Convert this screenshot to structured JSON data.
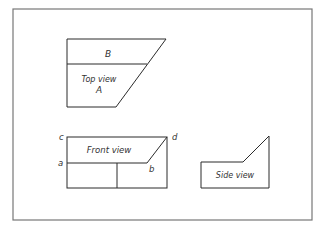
{
  "diagram": {
    "type": "orthographic-projection",
    "colors": {
      "line": "#2b2b2b",
      "frame": "#777777",
      "text": "#333333",
      "background": "#ffffff"
    },
    "top_view": {
      "region_upper_label": "B",
      "title": "Top view",
      "region_lower_label": "A"
    },
    "front_view": {
      "title": "Front view",
      "corner_labels": {
        "c": "c",
        "d": "d",
        "a": "a",
        "b": "b"
      }
    },
    "side_view": {
      "title": "Side view"
    }
  }
}
